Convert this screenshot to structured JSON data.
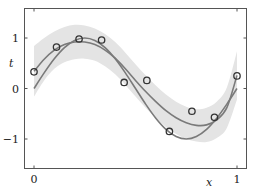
{
  "chart_data": {
    "type": "line",
    "title": "",
    "xlabel": "x",
    "ylabel": "t",
    "xlim": [
      -0.05,
      1.05
    ],
    "ylim": [
      -1.6,
      1.6
    ],
    "x_ticks": [
      {
        "value": 0,
        "label": "0"
      },
      {
        "value": 1,
        "label": "1"
      }
    ],
    "y_ticks": [
      {
        "value": 1,
        "label": "1"
      },
      {
        "value": 0,
        "label": "0"
      },
      {
        "value": -1,
        "label": "−1"
      }
    ],
    "grid": false,
    "legend": null,
    "series": [
      {
        "name": "true function sin(2πx)",
        "kind": "line",
        "color": "#7a7a7a",
        "x": [
          0,
          0.05,
          0.1,
          0.15,
          0.2,
          0.25,
          0.3,
          0.35,
          0.4,
          0.45,
          0.5,
          0.55,
          0.6,
          0.65,
          0.7,
          0.75,
          0.8,
          0.85,
          0.9,
          0.95,
          1.0
        ],
        "y": [
          0,
          0.309,
          0.588,
          0.809,
          0.951,
          1.0,
          0.951,
          0.809,
          0.588,
          0.309,
          0,
          -0.309,
          -0.588,
          -0.809,
          -0.951,
          -1.0,
          -0.951,
          -0.809,
          -0.588,
          -0.309,
          0
        ]
      },
      {
        "name": "predictive mean",
        "kind": "line",
        "color": "#7a7a7a",
        "x": [
          0,
          0.05,
          0.1,
          0.15,
          0.2,
          0.25,
          0.3,
          0.35,
          0.4,
          0.45,
          0.5,
          0.55,
          0.6,
          0.65,
          0.7,
          0.75,
          0.8,
          0.85,
          0.9,
          0.95,
          1.0
        ],
        "y": [
          0.34,
          0.58,
          0.76,
          0.87,
          0.92,
          0.92,
          0.87,
          0.76,
          0.6,
          0.39,
          0.16,
          -0.06,
          -0.26,
          -0.44,
          -0.58,
          -0.68,
          -0.73,
          -0.72,
          -0.62,
          -0.38,
          0.26
        ]
      },
      {
        "name": "predictive uncertainty band (±1 std)",
        "kind": "band",
        "color": "#e4e4e4",
        "x": [
          0,
          0.05,
          0.1,
          0.15,
          0.2,
          0.25,
          0.3,
          0.35,
          0.4,
          0.45,
          0.5,
          0.55,
          0.6,
          0.65,
          0.7,
          0.75,
          0.8,
          0.85,
          0.9,
          0.95,
          1.0
        ],
        "upper": [
          0.84,
          1.0,
          1.13,
          1.22,
          1.26,
          1.25,
          1.19,
          1.08,
          0.92,
          0.71,
          0.48,
          0.26,
          0.06,
          -0.12,
          -0.26,
          -0.36,
          -0.41,
          -0.38,
          -0.26,
          0.02,
          0.74
        ],
        "lower": [
          -0.16,
          0.16,
          0.39,
          0.52,
          0.58,
          0.59,
          0.55,
          0.44,
          0.28,
          0.07,
          -0.16,
          -0.38,
          -0.58,
          -0.76,
          -0.9,
          -1.0,
          -1.05,
          -1.06,
          -0.98,
          -0.78,
          -0.22
        ]
      },
      {
        "name": "observations",
        "kind": "scatter",
        "color": "#333333",
        "x": [
          0.0,
          0.111,
          0.222,
          0.333,
          0.444,
          0.556,
          0.667,
          0.778,
          0.889,
          1.0
        ],
        "y": [
          0.33,
          0.82,
          0.98,
          0.96,
          0.12,
          0.16,
          -0.85,
          -0.45,
          -0.57,
          0.25
        ]
      }
    ]
  }
}
